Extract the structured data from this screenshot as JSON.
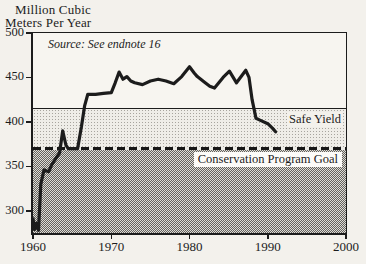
{
  "figure": {
    "ylabel_line1": "Million Cubic",
    "ylabel_line2": "Meters Per Year",
    "source_note": "Source: See endnote 16",
    "safe_yield_label": "Safe Yield",
    "goal_label": "Conservation Program Goal"
  },
  "colors": {
    "ink": "#1c1c1c",
    "paper": "#f3f1ec",
    "band_light_dot": "#a7a49e",
    "band_dark_check": "#64625e"
  },
  "chart_data": {
    "type": "line",
    "title": "",
    "xlabel": "",
    "ylabel": "Million Cubic Meters Per Year",
    "source": "Source: See endnote 16",
    "xlim": [
      1960,
      2000
    ],
    "ylim": [
      275,
      500
    ],
    "x_ticks": [
      1960,
      1970,
      1980,
      1990,
      2000
    ],
    "y_ticks": [
      300,
      350,
      400,
      450,
      500
    ],
    "grid": false,
    "legend_position": "inline-labels",
    "reference_lines": [
      {
        "name": "Safe Yield",
        "value": 415,
        "style": "solid"
      },
      {
        "name": "Conservation Program Goal",
        "value": 370,
        "style": "dashed"
      }
    ],
    "series": [
      {
        "name": "Water use (million cubic meters per year)",
        "points": [
          [
            1960.0,
            291
          ],
          [
            1960.2,
            279
          ],
          [
            1960.45,
            286
          ],
          [
            1960.7,
            278
          ],
          [
            1961.0,
            330
          ],
          [
            1961.4,
            346
          ],
          [
            1962.0,
            344
          ],
          [
            1962.4,
            352
          ],
          [
            1963.0,
            360
          ],
          [
            1963.4,
            365
          ],
          [
            1963.8,
            390
          ],
          [
            1964.2,
            374
          ],
          [
            1964.5,
            370
          ],
          [
            1965.7,
            370
          ],
          [
            1966.2,
            395
          ],
          [
            1966.6,
            418
          ],
          [
            1967.0,
            431
          ],
          [
            1968.0,
            431
          ],
          [
            1969.0,
            432
          ],
          [
            1970.0,
            433
          ],
          [
            1970.5,
            444
          ],
          [
            1971.0,
            456
          ],
          [
            1971.5,
            448
          ],
          [
            1972.0,
            451
          ],
          [
            1972.5,
            446
          ],
          [
            1973.0,
            444
          ],
          [
            1974.0,
            442
          ],
          [
            1975.0,
            446
          ],
          [
            1976.0,
            448
          ],
          [
            1977.0,
            446
          ],
          [
            1978.0,
            443
          ],
          [
            1979.0,
            451
          ],
          [
            1980.0,
            462
          ],
          [
            1980.6,
            455
          ],
          [
            1981.0,
            451
          ],
          [
            1982.0,
            444
          ],
          [
            1982.6,
            440
          ],
          [
            1983.2,
            438
          ],
          [
            1984.3,
            450
          ],
          [
            1985.1,
            457
          ],
          [
            1986.0,
            444
          ],
          [
            1987.2,
            458
          ],
          [
            1987.6,
            450
          ],
          [
            1988.0,
            425
          ],
          [
            1988.5,
            404
          ],
          [
            1989.0,
            402
          ],
          [
            1990.0,
            398
          ],
          [
            1990.6,
            393
          ],
          [
            1991.0,
            389
          ]
        ]
      }
    ]
  }
}
